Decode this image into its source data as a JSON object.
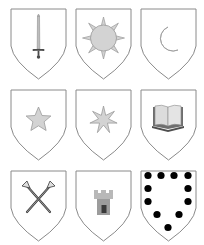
{
  "sheet": {
    "title": "Heraldic shields",
    "rows": 3,
    "columns": 3
  },
  "colors": {
    "outline": "#8a8a8a",
    "charge_fill": "#d3d3d3",
    "charge_stroke": "#9a9a9a",
    "dark": "#4a4a4a",
    "roundel": "#000000",
    "background": "#ffffff"
  },
  "shields": [
    {
      "position": "row1-col1",
      "charge": "sword",
      "icon": "sword-icon",
      "label": "Sword palewise"
    },
    {
      "position": "row1-col2",
      "charge": "sun",
      "icon": "sun-icon",
      "label": "Sun in splendour"
    },
    {
      "position": "row1-col3",
      "charge": "crescent moon",
      "icon": "crescent-moon-icon",
      "label": "Crescent moon"
    },
    {
      "position": "row2-col1",
      "charge": "star (mullet of five points)",
      "icon": "star-icon",
      "label": "Five-pointed star"
    },
    {
      "position": "row2-col2",
      "charge": "seven-pointed star",
      "icon": "seven-point-star-icon",
      "label": "Seven-pointed star"
    },
    {
      "position": "row2-col3",
      "charge": "open book",
      "icon": "open-book-icon",
      "label": "Open book"
    },
    {
      "position": "row3-col1",
      "charge": "two trumpets in saltire",
      "icon": "crossed-trumpets-icon",
      "label": "Crossed trumpets"
    },
    {
      "position": "row3-col2",
      "charge": "tower",
      "icon": "tower-icon",
      "label": "Tower"
    },
    {
      "position": "row3-col3",
      "charge": "bordure of roundels",
      "icon": "roundels-bordure-icon",
      "label": "Eleven roundels in orle",
      "roundel_count": 11
    }
  ]
}
